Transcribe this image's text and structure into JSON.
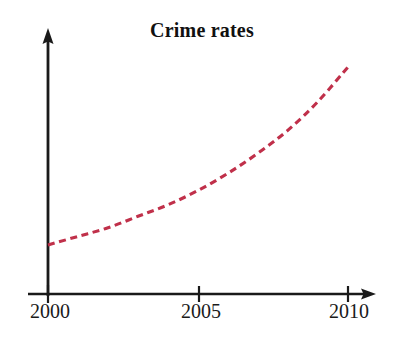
{
  "chart_data": {
    "type": "line",
    "title": "Crime rates",
    "subtitle": "",
    "xlabel": "",
    "ylabel": "",
    "xlim": [
      2000,
      2010
    ],
    "ylim": [
      0,
      100
    ],
    "grid": false,
    "legend": "none",
    "xtick_labels": [
      "2000",
      "2005",
      "2010"
    ],
    "xticks": [
      2000,
      2005,
      2010
    ],
    "ytick_labels": [],
    "line_style": "dashed",
    "line_color": "#c0304a",
    "axis_color": "#1a1a1a",
    "x_axis_arrow": true,
    "y_axis_arrow": true,
    "series": [
      {
        "name": "Crime rates",
        "x": [
          2000,
          2001,
          2002,
          2003,
          2004,
          2005,
          2006,
          2007,
          2008,
          2009,
          2010
        ],
        "values": [
          18,
          21,
          24,
          28,
          32,
          37,
          43,
          50,
          58,
          68,
          80
        ]
      }
    ],
    "annotations": []
  },
  "axes": {
    "x_tick_2000": "2000",
    "x_tick_2005": "2005",
    "x_tick_2010": "2010"
  },
  "title": {
    "text": "Crime rates"
  }
}
